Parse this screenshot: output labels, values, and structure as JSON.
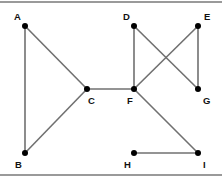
{
  "diagram": {
    "type": "undirected-graph",
    "colors": {
      "edge": "#707070",
      "node": "#000000",
      "label": "#111111",
      "border": "#9a9a9a"
    },
    "nodes": [
      {
        "id": "A",
        "label": "A",
        "x": 25,
        "y": 26,
        "lx": 14,
        "ly": 20
      },
      {
        "id": "B",
        "label": "B",
        "x": 25,
        "y": 153,
        "lx": 15,
        "ly": 168
      },
      {
        "id": "C",
        "label": "C",
        "x": 87,
        "y": 89,
        "lx": 88,
        "ly": 104
      },
      {
        "id": "D",
        "label": "D",
        "x": 134,
        "y": 26,
        "lx": 123,
        "ly": 20
      },
      {
        "id": "E",
        "label": "E",
        "x": 198,
        "y": 26,
        "lx": 204,
        "ly": 20
      },
      {
        "id": "F",
        "label": "F",
        "x": 134,
        "y": 89,
        "lx": 127,
        "ly": 104
      },
      {
        "id": "G",
        "label": "G",
        "x": 198,
        "y": 89,
        "lx": 203,
        "ly": 104
      },
      {
        "id": "H",
        "label": "H",
        "x": 134,
        "y": 153,
        "lx": 124,
        "ly": 168
      },
      {
        "id": "I",
        "label": "I",
        "x": 198,
        "y": 153,
        "lx": 203,
        "ly": 168
      }
    ],
    "edges": [
      [
        "A",
        "B"
      ],
      [
        "A",
        "C"
      ],
      [
        "B",
        "C"
      ],
      [
        "C",
        "F"
      ],
      [
        "D",
        "F"
      ],
      [
        "D",
        "G"
      ],
      [
        "E",
        "F"
      ],
      [
        "E",
        "G"
      ],
      [
        "F",
        "I"
      ],
      [
        "H",
        "I"
      ]
    ]
  }
}
